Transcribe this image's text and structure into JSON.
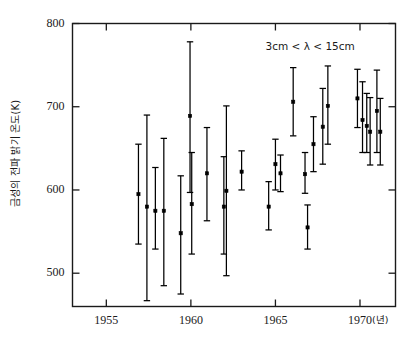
{
  "chart_data": {
    "type": "scatter",
    "title": "",
    "subtitle": "",
    "xlabel": "(년)",
    "ylabel": "금성의 전파 밝기 온도(K)",
    "xlim": [
      1953.0,
      1972.1
    ],
    "ylim": [
      460,
      800
    ],
    "xticks": [
      1955,
      1960,
      1965,
      1970
    ],
    "xtick_labels": [
      "1955",
      "1960",
      "1965",
      "1970"
    ],
    "yticks": [
      500,
      600,
      700,
      800
    ],
    "ytick_labels": [
      "500",
      "600",
      "700",
      "800"
    ],
    "grid": false,
    "legend_position": "none",
    "annotations": [
      {
        "text": "3cm < λ < 15cm",
        "x": 1968.2,
        "y": 772
      }
    ],
    "error_bar_style": "vertical-with-caps",
    "marker": "filled-square",
    "series": [
      {
        "name": "Venus radio brightness temperature",
        "points": [
          {
            "x": 1956.9,
            "y": 595,
            "yerr_low": 535,
            "yerr_high": 655
          },
          {
            "x": 1957.4,
            "y": 580,
            "yerr_low": 467,
            "yerr_high": 690
          },
          {
            "x": 1957.9,
            "y": 575,
            "yerr_low": 529,
            "yerr_high": 627
          },
          {
            "x": 1958.4,
            "y": 575,
            "yerr_low": 485,
            "yerr_high": 662
          },
          {
            "x": 1959.4,
            "y": 548,
            "yerr_low": 475,
            "yerr_high": 617
          },
          {
            "x": 1959.95,
            "y": 689,
            "yerr_low": 597,
            "yerr_high": 778
          },
          {
            "x": 1960.05,
            "y": 583,
            "yerr_low": 523,
            "yerr_high": 645
          },
          {
            "x": 1960.95,
            "y": 620,
            "yerr_low": 563,
            "yerr_high": 675
          },
          {
            "x": 1961.95,
            "y": 580,
            "yerr_low": 523,
            "yerr_high": 640
          },
          {
            "x": 1962.1,
            "y": 599,
            "yerr_low": 497,
            "yerr_high": 701
          },
          {
            "x": 1963.0,
            "y": 622,
            "yerr_low": 600,
            "yerr_high": 647
          },
          {
            "x": 1964.6,
            "y": 580,
            "yerr_low": 552,
            "yerr_high": 610
          },
          {
            "x": 1965.0,
            "y": 631,
            "yerr_low": 600,
            "yerr_high": 661
          },
          {
            "x": 1965.3,
            "y": 620,
            "yerr_low": 598,
            "yerr_high": 642
          },
          {
            "x": 1966.05,
            "y": 706,
            "yerr_low": 665,
            "yerr_high": 747
          },
          {
            "x": 1966.75,
            "y": 619,
            "yerr_low": 596,
            "yerr_high": 645
          },
          {
            "x": 1966.9,
            "y": 555,
            "yerr_low": 529,
            "yerr_high": 582
          },
          {
            "x": 1967.25,
            "y": 655,
            "yerr_low": 622,
            "yerr_high": 688
          },
          {
            "x": 1967.8,
            "y": 676,
            "yerr_low": 631,
            "yerr_high": 722
          },
          {
            "x": 1968.1,
            "y": 701,
            "yerr_low": 655,
            "yerr_high": 749
          },
          {
            "x": 1969.85,
            "y": 710,
            "yerr_low": 675,
            "yerr_high": 745
          },
          {
            "x": 1970.15,
            "y": 684,
            "yerr_low": 645,
            "yerr_high": 730
          },
          {
            "x": 1970.4,
            "y": 677,
            "yerr_low": 645,
            "yerr_high": 716
          },
          {
            "x": 1970.6,
            "y": 670,
            "yerr_low": 630,
            "yerr_high": 711
          },
          {
            "x": 1971.0,
            "y": 695,
            "yerr_low": 645,
            "yerr_high": 744
          },
          {
            "x": 1971.2,
            "y": 670,
            "yerr_low": 630,
            "yerr_high": 710
          }
        ]
      }
    ]
  },
  "style": {
    "axis_color": "#1a1a1a",
    "marker_color": "#000000",
    "background": "#ffffff"
  }
}
